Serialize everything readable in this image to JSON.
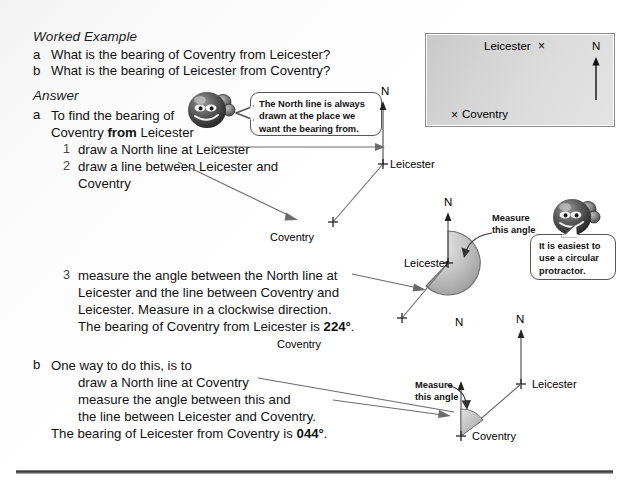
{
  "page": {
    "heading": "Worked Example",
    "answer_heading": "Answer"
  },
  "questions": [
    {
      "marker": "a",
      "text": "What is the bearing of Coventry from Leicester?"
    },
    {
      "marker": "b",
      "text": "What is the bearing of Leicester from Coventry?"
    }
  ],
  "answer_a": {
    "marker": "a",
    "line1": "To find the bearing of",
    "line2_pre": "Coventry ",
    "line2_bold": "from",
    "line2_post": " Leicester",
    "steps": [
      {
        "num": "1",
        "text": "draw a North line at Leicester"
      },
      {
        "num": "2",
        "text": "draw a line between Leicester and"
      },
      {
        "num": "",
        "text": "Coventry"
      }
    ],
    "step3": {
      "num": "3",
      "line1": "measure the angle between the North line at",
      "line2": "Leicester and the line between Coventry and",
      "line3": "Leicester. Measure in a clockwise direction.",
      "line4_pre": "The bearing of Coventry from Leicester is ",
      "line4_value": "224°",
      "line4_post": "."
    }
  },
  "answer_b": {
    "marker": "b",
    "line1": "One way to do this, is to",
    "line2": "draw a North line at Coventry",
    "line3": "measure the angle between this and",
    "line4": "the line between Leicester and Coventry.",
    "line5_pre": "The bearing of Leicester from Coventry is ",
    "line5_value": "044°",
    "line5_post": "."
  },
  "bubbles": {
    "north_line": {
      "line1": "The North line is always",
      "line2": "drawn at the place we",
      "line3_pre": "want the bearing ",
      "line3_bold": "from",
      "line3_post": "."
    },
    "protractor": {
      "line1": "It is easiest to",
      "line2": "use a circular",
      "line3": "protractor."
    }
  },
  "map_box": {
    "leicester_label": "Leicester",
    "leicester_cross": "×",
    "coventry_cross": "×",
    "coventry_label": "Coventry",
    "north_label": "N"
  },
  "diagram1": {
    "north_label": "N",
    "leicester_label": "Leicester",
    "coventry_label": "Coventry",
    "leicester_cross": "+",
    "coventry_cross": "+"
  },
  "diagram2": {
    "north_label": "N",
    "leicester_label": "Leicester",
    "coventry_label": "Coventry",
    "leicester_cross": "+",
    "coventry_cross": "+",
    "measure_line1": "Measure",
    "measure_line2": "this angle"
  },
  "diagram3": {
    "north_label_leicester": "N",
    "north_label_coventry": "N",
    "leicester_label": "Leicester",
    "coventry_label": "Coventry",
    "leicester_cross": "+",
    "coventry_cross": "+",
    "measure_line1": "Measure",
    "measure_line2": "this angle"
  },
  "colors": {
    "text": "#111111",
    "line": "#6b6b6b",
    "map_fill": "#d6d6d6",
    "protractor_fill": "#b9b9b9",
    "rule": "#3a3a3a"
  }
}
